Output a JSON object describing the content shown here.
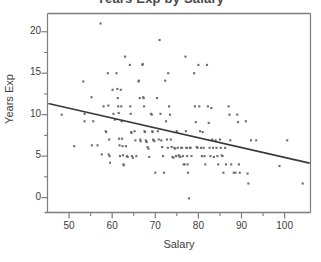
{
  "chart_data": {
    "type": "scatter",
    "title": "Years Exp by Salary",
    "xlabel": "Salary",
    "ylabel": "Years Exp",
    "xlim": [
      45,
      106
    ],
    "ylim": [
      -1.8,
      22.2
    ],
    "grid": false,
    "legend": false,
    "x_ticks_major": [
      50,
      60,
      70,
      80,
      90,
      100
    ],
    "x_ticks_minor": [
      55,
      65,
      75,
      85,
      95
    ],
    "y_ticks_major": [
      0,
      5,
      10,
      15,
      20
    ],
    "y_ticks_minor": [
      2.5,
      7.5,
      12.5,
      17.5,
      22.5
    ],
    "point_color": "#6b6b6b",
    "line_color": "#3a3a3a",
    "frame_color": "#7d7d7d",
    "trend_line": {
      "x_start": 45.2,
      "y_start": 11.35,
      "x_end": 105.8,
      "y_end": 4.15
    },
    "points": [
      [
        48.3,
        10.0
      ],
      [
        51.2,
        6.2
      ],
      [
        53.3,
        14.0
      ],
      [
        53.6,
        10.1
      ],
      [
        53.6,
        9.2
      ],
      [
        55.2,
        12.1
      ],
      [
        55.3,
        6.3
      ],
      [
        55.6,
        9.2
      ],
      [
        56.6,
        6.3
      ],
      [
        57.3,
        21.0
      ],
      [
        57.6,
        5.2
      ],
      [
        58.0,
        11.0
      ],
      [
        58.5,
        8.0
      ],
      [
        58.6,
        7.9
      ],
      [
        59.0,
        15.0
      ],
      [
        59.1,
        11.1
      ],
      [
        59.2,
        5.2
      ],
      [
        59.3,
        7.0
      ],
      [
        59.4,
        5.0
      ],
      [
        59.5,
        4.2
      ],
      [
        60.1,
        13.0
      ],
      [
        60.3,
        10.1
      ],
      [
        60.6,
        9.4
      ],
      [
        61.0,
        15.0
      ],
      [
        61.2,
        13.1
      ],
      [
        61.3,
        12.0
      ],
      [
        61.4,
        11.0
      ],
      [
        61.5,
        10.2
      ],
      [
        61.6,
        7.1
      ],
      [
        61.7,
        6.3
      ],
      [
        61.8,
        5.0
      ],
      [
        62.0,
        13.0
      ],
      [
        62.1,
        11.0
      ],
      [
        62.2,
        9.2
      ],
      [
        62.3,
        7.1
      ],
      [
        62.4,
        6.2
      ],
      [
        62.5,
        5.1
      ],
      [
        62.6,
        4.0
      ],
      [
        62.7,
        3.9
      ],
      [
        63.0,
        17.0
      ],
      [
        63.2,
        6.2
      ],
      [
        63.4,
        5.0
      ],
      [
        63.6,
        4.9
      ],
      [
        64.1,
        16.0
      ],
      [
        64.2,
        11.0
      ],
      [
        64.3,
        10.1
      ],
      [
        64.4,
        7.9
      ],
      [
        64.5,
        7.8
      ],
      [
        64.6,
        5.0
      ],
      [
        64.8,
        4.8
      ],
      [
        65.2,
        8.0
      ],
      [
        65.4,
        6.9
      ],
      [
        65.6,
        5.0
      ],
      [
        66.1,
        14.0
      ],
      [
        66.2,
        14.1
      ],
      [
        66.4,
        12.0
      ],
      [
        66.5,
        7.0
      ],
      [
        66.6,
        6.8
      ],
      [
        67.0,
        16.0
      ],
      [
        67.1,
        16.1
      ],
      [
        67.2,
        12.1
      ],
      [
        67.3,
        12.0
      ],
      [
        67.4,
        11.0
      ],
      [
        67.5,
        8.0
      ],
      [
        67.6,
        7.9
      ],
      [
        67.8,
        6.9
      ],
      [
        67.9,
        6.8
      ],
      [
        68.0,
        6.7
      ],
      [
        68.2,
        6.1
      ],
      [
        68.4,
        5.9
      ],
      [
        68.6,
        4.9
      ],
      [
        69.0,
        10.1
      ],
      [
        69.2,
        10.0
      ],
      [
        69.3,
        8.0
      ],
      [
        69.4,
        7.9
      ],
      [
        69.5,
        7.0
      ],
      [
        69.6,
        6.9
      ],
      [
        69.8,
        6.8
      ],
      [
        70.0,
        3.0
      ],
      [
        70.4,
        12.0
      ],
      [
        70.6,
        8.0
      ],
      [
        70.8,
        7.0
      ],
      [
        71.0,
        19.0
      ],
      [
        71.2,
        10.1
      ],
      [
        71.4,
        6.9
      ],
      [
        71.6,
        6.1
      ],
      [
        71.8,
        5.0
      ],
      [
        72.0,
        3.0
      ],
      [
        72.3,
        14.1
      ],
      [
        72.5,
        9.2
      ],
      [
        72.7,
        7.0
      ],
      [
        72.9,
        6.0
      ],
      [
        73.0,
        15.0
      ],
      [
        73.2,
        11.0
      ],
      [
        73.4,
        10.0
      ],
      [
        73.6,
        7.0
      ],
      [
        73.8,
        6.1
      ],
      [
        74.0,
        4.9
      ],
      [
        74.2,
        4.8
      ],
      [
        74.4,
        6.0
      ],
      [
        74.6,
        5.9
      ],
      [
        74.8,
        5.0
      ],
      [
        75.0,
        8.0
      ],
      [
        75.2,
        6.0
      ],
      [
        75.4,
        5.1
      ],
      [
        75.6,
        5.0
      ],
      [
        75.8,
        4.9
      ],
      [
        76.0,
        6.0
      ],
      [
        76.2,
        6.0
      ],
      [
        76.4,
        5.0
      ],
      [
        76.6,
        4.0
      ],
      [
        76.8,
        4.0
      ],
      [
        77.0,
        17.0
      ],
      [
        77.1,
        8.0
      ],
      [
        77.2,
        6.0
      ],
      [
        77.3,
        6.0
      ],
      [
        77.4,
        5.0
      ],
      [
        77.5,
        4.0
      ],
      [
        77.6,
        3.0
      ],
      [
        77.8,
        -0.1
      ],
      [
        78.0,
        6.0
      ],
      [
        78.2,
        6.0
      ],
      [
        78.4,
        5.0
      ],
      [
        79.0,
        15.0
      ],
      [
        79.2,
        11.0
      ],
      [
        79.4,
        9.1
      ],
      [
        79.6,
        6.1
      ],
      [
        79.8,
        6.0
      ],
      [
        80.0,
        16.0
      ],
      [
        80.2,
        11.0
      ],
      [
        80.4,
        8.0
      ],
      [
        80.6,
        6.0
      ],
      [
        80.8,
        5.0
      ],
      [
        81.0,
        7.9
      ],
      [
        81.2,
        6.0
      ],
      [
        81.4,
        5.0
      ],
      [
        81.6,
        4.0
      ],
      [
        82.0,
        16.0
      ],
      [
        82.2,
        11.0
      ],
      [
        82.4,
        9.0
      ],
      [
        82.6,
        6.0
      ],
      [
        82.8,
        5.0
      ],
      [
        83.0,
        10.8
      ],
      [
        83.2,
        7.0
      ],
      [
        83.4,
        6.0
      ],
      [
        83.6,
        4.9
      ],
      [
        84.0,
        6.9
      ],
      [
        84.2,
        6.0
      ],
      [
        84.4,
        5.0
      ],
      [
        84.6,
        4.0
      ],
      [
        85.0,
        7.0
      ],
      [
        85.2,
        6.0
      ],
      [
        85.4,
        5.1
      ],
      [
        85.6,
        5.0
      ],
      [
        85.8,
        3.0
      ],
      [
        86.2,
        6.0
      ],
      [
        86.4,
        4.0
      ],
      [
        87.0,
        11.0
      ],
      [
        87.2,
        10.0
      ],
      [
        87.4,
        6.9
      ],
      [
        87.6,
        4.0
      ],
      [
        88.2,
        3.0
      ],
      [
        88.6,
        3.0
      ],
      [
        89.0,
        10.0
      ],
      [
        89.2,
        9.1
      ],
      [
        89.4,
        4.0
      ],
      [
        89.6,
        3.0
      ],
      [
        91.0,
        9.2
      ],
      [
        91.4,
        2.9
      ],
      [
        91.6,
        1.7
      ],
      [
        92.2,
        6.9
      ],
      [
        93.4,
        6.9
      ],
      [
        98.8,
        3.8
      ],
      [
        100.6,
        6.9
      ],
      [
        104.2,
        1.7
      ]
    ]
  }
}
